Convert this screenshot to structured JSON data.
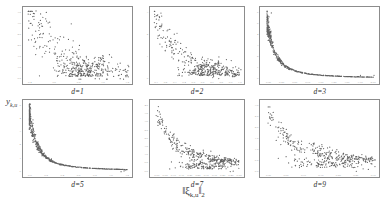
{
  "figure": {
    "ylabel": "y",
    "ylabel_sub": "k,u",
    "xlabel_norm_open": "‖",
    "xlabel_symbol": "ξ",
    "xlabel_sub": "k,u",
    "xlabel_norm_close": "‖",
    "xlabel_order": "2",
    "point_color": "#3b3b3b",
    "frame_color": "#8c8c8c",
    "tick_color": "#9a9a9a",
    "background": "#ffffff"
  },
  "chart_data": [
    {
      "type": "scatter",
      "title": "d=1",
      "xlabel": "",
      "ylabel": "",
      "xlim": [
        0.18,
        1.38
      ],
      "ylim": [
        0.4,
        3.6
      ],
      "xticks": [
        "0.4",
        "0.6",
        "0.8",
        "1.0",
        "1.2"
      ],
      "yticks": [
        "0.5",
        "1.0",
        "1.5",
        "2.0",
        "2.5",
        "3.0",
        "3.5"
      ],
      "grid": false,
      "n_points": 430,
      "shape": "diffuse-decay",
      "seed": 11,
      "spread": 0.42,
      "decay": 1.15,
      "y_floor": 0.55,
      "y_top": 3.4,
      "blob_x": 0.82,
      "blob_frac": 0.55
    },
    {
      "type": "scatter",
      "title": "d=2",
      "xlabel": "",
      "ylabel": "",
      "xlim": [
        0.05,
        1.0
      ],
      "ylim": [
        0.0,
        3.2
      ],
      "xticks": [
        "0.1",
        "0.2",
        "0.3",
        "0.4",
        "0.5",
        "0.6",
        "0.7",
        "0.8",
        "0.9",
        "1.0"
      ],
      "yticks": [
        "0",
        "1",
        "2",
        "3"
      ],
      "grid": false,
      "n_points": 400,
      "shape": "broadening-decay",
      "seed": 22,
      "spread": 0.3,
      "decay": 1.3,
      "y_floor": 0.18,
      "y_top": 2.95,
      "blob_x": 0.62,
      "blob_frac": 0.45
    },
    {
      "type": "scatter",
      "title": "d=3",
      "xlabel": "",
      "ylabel": "",
      "xlim": [
        0.0,
        2.0
      ],
      "ylim": [
        0.0,
        6.2
      ],
      "xticks": [
        "0.00",
        "0.25",
        "0.50",
        "0.75",
        "1.00",
        "1.25",
        "1.50",
        "1.75",
        "2.00"
      ],
      "yticks": [
        "0",
        "1",
        "2",
        "3",
        "4",
        "5",
        "6"
      ],
      "grid": false,
      "n_points": 520,
      "shape": "hyperbolic",
      "seed": 33,
      "spread": 0.07,
      "decay": 3.4,
      "y_floor": 0.1,
      "y_top": 5.6,
      "blob_x": 1.35,
      "blob_frac": 0.3
    },
    {
      "type": "scatter",
      "title": "d=5",
      "xlabel": "",
      "ylabel": "",
      "xlim": [
        0.0,
        1.35
      ],
      "ylim": [
        0.0,
        5.2
      ],
      "xticks": [
        "0.0",
        "0.2",
        "0.4",
        "0.6",
        "0.8",
        "1.0",
        "1.2"
      ],
      "yticks": [
        "0",
        "1",
        "2",
        "3",
        "4",
        "5"
      ],
      "grid": false,
      "n_points": 520,
      "shape": "hyperbolic",
      "seed": 55,
      "spread": 0.08,
      "decay": 3.1,
      "y_floor": 0.12,
      "y_top": 4.7,
      "blob_x": 0.85,
      "blob_frac": 0.32
    },
    {
      "type": "scatter",
      "title": "d=7",
      "xlabel": "",
      "ylabel": "",
      "xlim": [
        0.0,
        0.5
      ],
      "ylim": [
        0.0,
        4.2
      ],
      "xticks": [
        "0.00",
        "0.05",
        "0.10",
        "0.15",
        "0.20",
        "0.25",
        "0.30",
        "0.35",
        "0.40",
        "0.45",
        "0.50"
      ],
      "yticks": [
        "0.0",
        "0.5",
        "1.0",
        "1.5",
        "2.0",
        "2.5",
        "3.0",
        "3.5",
        "4.0"
      ],
      "grid": false,
      "n_points": 430,
      "shape": "convex-decay",
      "seed": 77,
      "spread": 0.22,
      "decay": 1.7,
      "y_floor": 0.22,
      "y_top": 3.85,
      "blob_x": 0.3,
      "blob_frac": 0.4
    },
    {
      "type": "scatter",
      "title": "d=9",
      "xlabel": "",
      "ylabel": "",
      "xlim": [
        0.0,
        0.3
      ],
      "ylim": [
        0.0,
        3.4
      ],
      "xticks": [
        "0.00",
        "0.05",
        "0.10",
        "0.15",
        "0.20",
        "0.25",
        "0.30"
      ],
      "yticks": [
        "0.0",
        "0.5",
        "1.0",
        "1.5",
        "2.0",
        "2.5",
        "3.0"
      ],
      "grid": false,
      "n_points": 400,
      "shape": "convex-decay",
      "seed": 99,
      "spread": 0.2,
      "decay": 1.55,
      "y_floor": 0.25,
      "y_top": 3.05,
      "blob_x": 0.175,
      "blob_frac": 0.38
    }
  ]
}
